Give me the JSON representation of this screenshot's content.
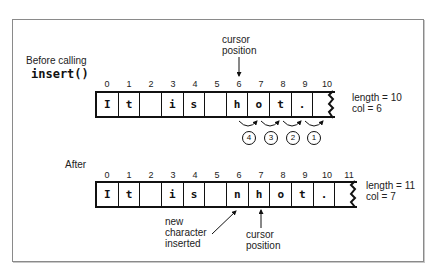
{
  "before": {
    "title_line1": "Before calling",
    "title_line2": "insert()",
    "indices": [
      "0",
      "1",
      "2",
      "3",
      "4",
      "5",
      "6",
      "7",
      "8",
      "9",
      "10"
    ],
    "cells": [
      "I",
      "t",
      "",
      "i",
      "s",
      "",
      "h",
      "o",
      "t",
      ".",
      ""
    ],
    "cursor_label_line1": "cursor",
    "cursor_label_line2": "position",
    "stats_length": "length = 10",
    "stats_col": "col = 6",
    "steps": [
      "4",
      "3",
      "2",
      "1"
    ]
  },
  "after": {
    "title": "After",
    "indices": [
      "0",
      "1",
      "2",
      "3",
      "4",
      "5",
      "6",
      "7",
      "8",
      "9",
      "10",
      "11"
    ],
    "cells": [
      "I",
      "t",
      "",
      "i",
      "s",
      "",
      "n",
      "h",
      "o",
      "t",
      "."
    ],
    "new_char_line1": "new",
    "new_char_line2": "character",
    "new_char_line3": "inserted",
    "cursor_label_line1": "cursor",
    "cursor_label_line2": "position",
    "stats_length": "length = 11",
    "stats_col": "col = 7"
  }
}
